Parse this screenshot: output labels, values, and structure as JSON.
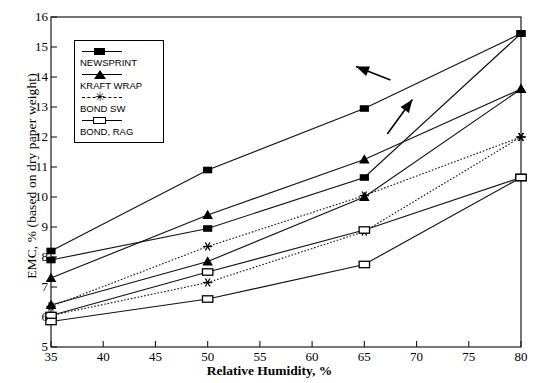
{
  "chart_data": {
    "type": "line",
    "title": "",
    "xlabel": "Relative Humidity, %",
    "ylabel": "EMC, % (based on dry paper weight)",
    "xlim": [
      35,
      80
    ],
    "ylim": [
      5,
      16
    ],
    "xticks": [
      35,
      40,
      45,
      50,
      55,
      60,
      65,
      70,
      75,
      80
    ],
    "yticks": [
      5,
      6,
      7,
      8,
      9,
      10,
      11,
      12,
      13,
      14,
      15,
      16
    ],
    "grid": false,
    "legend_position": "upper-left-inside",
    "x": [
      35,
      50,
      65,
      80
    ],
    "series": [
      {
        "name": "NEWSPRINT",
        "marker": "filled-square",
        "line": "solid",
        "branch": "upper",
        "values": [
          8.2,
          10.9,
          12.95,
          15.45
        ]
      },
      {
        "name": "NEWSPRINT",
        "marker": "filled-square",
        "line": "solid",
        "branch": "lower",
        "values": [
          7.9,
          8.95,
          10.65,
          15.45
        ]
      },
      {
        "name": "KRAFT WRAP",
        "marker": "filled-triangle",
        "line": "solid",
        "branch": "upper",
        "values": [
          7.3,
          9.4,
          11.25,
          13.6
        ]
      },
      {
        "name": "KRAFT WRAP",
        "marker": "filled-triangle",
        "line": "solid",
        "branch": "lower",
        "values": [
          6.4,
          7.85,
          10.0,
          13.6
        ]
      },
      {
        "name": "BOND SW",
        "marker": "asterisk",
        "line": "dotted",
        "branch": "upper",
        "values": [
          6.35,
          8.35,
          10.05,
          12.0
        ]
      },
      {
        "name": "BOND SW",
        "marker": "asterisk",
        "line": "dotted",
        "branch": "lower",
        "values": [
          6.05,
          7.15,
          8.85,
          12.0
        ]
      },
      {
        "name": "BOND, RAG",
        "marker": "open-rect",
        "line": "solid",
        "branch": "upper",
        "values": [
          6.05,
          7.5,
          8.9,
          10.65
        ]
      },
      {
        "name": "BOND, RAG",
        "marker": "open-rect",
        "line": "solid",
        "branch": "lower",
        "values": [
          5.85,
          6.6,
          7.75,
          10.65
        ]
      }
    ],
    "legend": [
      {
        "label": "NEWSPRINT",
        "marker": "filled-square"
      },
      {
        "label": "KRAFT WRAP",
        "marker": "filled-triangle"
      },
      {
        "label": "BOND SW",
        "marker": "asterisk"
      },
      {
        "label": "BOND, RAG",
        "marker": "open-rect"
      }
    ],
    "annotations": [
      {
        "name": "arrow-desorption",
        "type": "arrow",
        "direction": "up-left",
        "from": [
          67.5,
          13.9
        ],
        "to": [
          64.2,
          14.35
        ]
      },
      {
        "name": "arrow-adsorption",
        "type": "arrow",
        "direction": "up-right",
        "from": [
          67.2,
          12.1
        ],
        "to": [
          69.6,
          13.25
        ]
      }
    ]
  },
  "axis": {
    "x_tick_labels": [
      "35",
      "40",
      "45",
      "50",
      "55",
      "60",
      "65",
      "70",
      "75",
      "80"
    ],
    "y_tick_labels": [
      "5",
      "6",
      "7",
      "8",
      "9",
      "10",
      "11",
      "12",
      "13",
      "14",
      "15",
      "16"
    ],
    "x_title": "Relative Humidity, %",
    "y_title": "EMC, % (based on dry paper weight)"
  },
  "icons": {
    "asterisk_glyph": "✳"
  }
}
